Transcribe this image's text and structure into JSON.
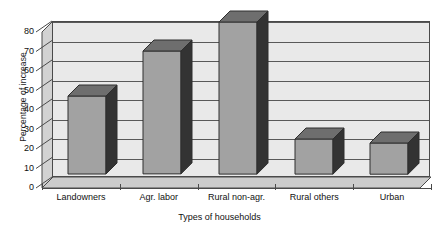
{
  "chart_data": {
    "type": "bar",
    "title": "",
    "subtitle": "",
    "xlabel": "Types of households",
    "ylabel": "Percentage of increase",
    "categories": [
      "Landowners",
      "Agr. labor",
      "Rural non-agr.",
      "Rural others",
      "Urban"
    ],
    "values": [
      40,
      63,
      78,
      18,
      16
    ],
    "ylim": [
      0,
      80
    ],
    "yticks": [
      0,
      10,
      20,
      30,
      40,
      50,
      60,
      70,
      80
    ],
    "ytick_labels": [
      "0",
      "10",
      "20",
      "30",
      "40",
      "50",
      "60",
      "70",
      "80"
    ],
    "grid": true,
    "legend": "none",
    "style": "3d-column",
    "colors": {
      "bar_face": "#a2a2a2",
      "bar_side": "#333333",
      "bar_top": "#6e6e6e",
      "plot_background": "#e9e9e9",
      "wall": "#d2d2d2",
      "floor": "#c9c9c9",
      "axis": "#4a4a4a",
      "gridline": "#595959",
      "text": "#111111",
      "page_background": "#ffffff"
    }
  }
}
